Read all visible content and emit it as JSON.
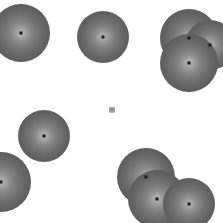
{
  "scene": {
    "width": 223,
    "height": 223,
    "background_color": "#ffffff",
    "description": "Grayscale radially-shaded circular particles with dark center markers on a white field; several particles are clipped by the frame edges and some overlap into clusters.",
    "particle_fill_center_color": "#b9b9b9",
    "particle_fill_edge_color": "#515151",
    "center_marker_color": "#1a1a1a",
    "particle_count": 10,
    "cluster_count": 5
  },
  "particles": [
    {
      "id": "p1",
      "label": "top-left-clipped",
      "cx": 21,
      "cy": 33,
      "r": 29,
      "clipped": "left-top"
    },
    {
      "id": "p2",
      "label": "top-center",
      "cx": 103,
      "cy": 37,
      "r": 26,
      "clipped": "none"
    },
    {
      "id": "p3",
      "label": "top-right-upper-left",
      "cx": 189,
      "cy": 38,
      "r": 29,
      "clipped": "none"
    },
    {
      "id": "p4",
      "label": "top-right-upper-right",
      "cx": 210,
      "cy": 45,
      "r": 25,
      "clipped": "right"
    },
    {
      "id": "p5",
      "label": "top-right-lower",
      "cx": 189,
      "cy": 63,
      "r": 29,
      "clipped": "right"
    },
    {
      "id": "p6",
      "label": "center-speck",
      "cx": 112,
      "cy": 110,
      "r": 3,
      "clipped": "none"
    },
    {
      "id": "p7",
      "label": "mid-left",
      "cx": 44,
      "cy": 136,
      "r": 26,
      "clipped": "none"
    },
    {
      "id": "p8",
      "label": "bottom-left-clipped",
      "cx": 1,
      "cy": 182,
      "r": 30,
      "clipped": "left-bottom"
    },
    {
      "id": "p9",
      "label": "bottom-right-upper-left",
      "cx": 146,
      "cy": 177,
      "r": 29,
      "clipped": "bottom"
    },
    {
      "id": "p10",
      "label": "bottom-right-middle",
      "cx": 157,
      "cy": 199,
      "r": 29,
      "clipped": "bottom"
    },
    {
      "id": "p11",
      "label": "bottom-right-right",
      "cx": 189,
      "cy": 204,
      "r": 26,
      "clipped": "bottom"
    }
  ]
}
